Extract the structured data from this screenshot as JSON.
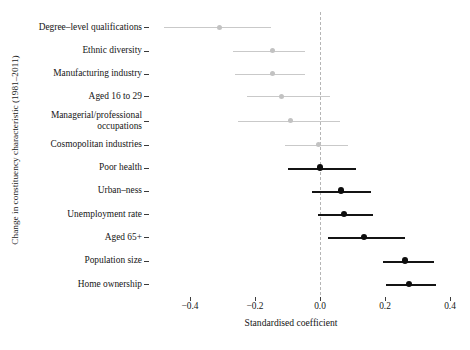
{
  "chart_data": {
    "type": "scatter",
    "title": "",
    "xlabel": "Standardised coefficient",
    "ylabel": "Change in constituency characteristic (1981–2011)",
    "xlim": [
      -0.5,
      0.42
    ],
    "xticks": [
      -0.4,
      -0.2,
      0.0,
      0.2,
      0.4
    ],
    "xtick_labels": [
      "−0.4",
      "−0.2",
      "0.0",
      "0.2",
      "0.4"
    ],
    "grid": false,
    "legend": "none",
    "reference_line": {
      "x": 0.0,
      "style": "dashed",
      "color": "#b5b5b5"
    },
    "annotation": "Horizontal bars are confidence intervals; dark series are significant (interval excludes or touches zero on the positive side), light grey series are non-significant.",
    "categories": [
      "Degree–level qualifications",
      "Ethnic diversity",
      "Manufacturing industry",
      "Aged 16 to 29",
      "Managerial/professional\noccupations",
      "Cosmopolitan industries",
      "Poor health",
      "Urban–ness",
      "Unemployment rate",
      "Aged 65+",
      "Population size",
      "Home ownership"
    ],
    "points": [
      {
        "label": "Degree–level qualifications",
        "estimate": -0.31,
        "low": -0.48,
        "high": -0.15,
        "emphasis": "light"
      },
      {
        "label": "Ethnic diversity",
        "estimate": -0.145,
        "low": -0.268,
        "high": -0.046,
        "emphasis": "light"
      },
      {
        "label": "Manufacturing industry",
        "estimate": -0.145,
        "low": -0.262,
        "high": -0.046,
        "emphasis": "light"
      },
      {
        "label": "Aged 16 to 29",
        "estimate": -0.117,
        "low": -0.225,
        "high": 0.031,
        "emphasis": "light"
      },
      {
        "label": "Managerial/professional occupations",
        "estimate": -0.092,
        "low": -0.252,
        "high": 0.062,
        "emphasis": "light"
      },
      {
        "label": "Cosmopolitan industries",
        "estimate": -0.006,
        "low": -0.108,
        "high": 0.086,
        "emphasis": "light"
      },
      {
        "label": "Poor health",
        "estimate": 0.0,
        "low": -0.098,
        "high": 0.111,
        "emphasis": "dark"
      },
      {
        "label": "Urban–ness",
        "estimate": 0.065,
        "low": -0.025,
        "high": 0.157,
        "emphasis": "dark"
      },
      {
        "label": "Unemployment rate",
        "estimate": 0.074,
        "low": -0.006,
        "high": 0.163,
        "emphasis": "dark"
      },
      {
        "label": "Aged 65+",
        "estimate": 0.135,
        "low": 0.025,
        "high": 0.262,
        "emphasis": "dark"
      },
      {
        "label": "Population size",
        "estimate": 0.262,
        "low": 0.194,
        "high": 0.351,
        "emphasis": "dark"
      },
      {
        "label": "Home ownership",
        "estimate": 0.274,
        "low": 0.203,
        "high": 0.357,
        "emphasis": "dark"
      }
    ]
  },
  "colors": {
    "light_series": "#c9c9c9",
    "dark_series": "#141414",
    "reference_line": "#b5b5b5",
    "text": "#161616",
    "background": "#ffffff"
  }
}
